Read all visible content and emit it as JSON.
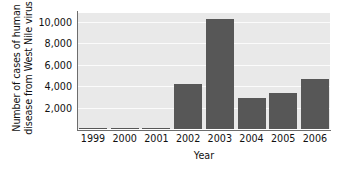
{
  "chart_data": {
    "type": "bar",
    "title": "",
    "xlabel": "Year",
    "ylabel": "Number of cases of human disease from West Nile virus",
    "ylabel_lines": [
      "Number of cases of human",
      "disease from West Nile virus"
    ],
    "categories": [
      "1999",
      "2000",
      "2001",
      "2002",
      "2003",
      "2004",
      "2005",
      "2006"
    ],
    "values": [
      62,
      21,
      66,
      4156,
      10200,
      2866,
      3330,
      4630
    ],
    "ylim": [
      0,
      10800
    ],
    "yticks": [
      2000,
      4000,
      6000,
      8000,
      10000
    ],
    "ytick_labels": [
      "2,000",
      "4,000",
      "6,000",
      "8,000",
      "10,000"
    ],
    "grid": true,
    "grid_axis": "y",
    "legend": "none",
    "bar_color": "#575757",
    "plot_background": "#e9e9e9",
    "gridline_color": "#fbfbfb",
    "axis_color": "#6d6d6d"
  }
}
